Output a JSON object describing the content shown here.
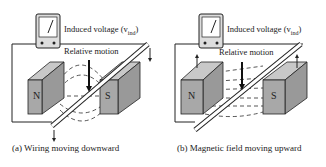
{
  "panels": [
    {
      "id": "a",
      "caption": "(a) Wiring moving downward",
      "voltage_label": "Induced voltage (v",
      "voltage_sub": "ind",
      "voltage_close": ")",
      "motion_label": "Relative motion",
      "north_label": "N",
      "south_label": "S"
    },
    {
      "id": "b",
      "caption": "(b) Magnetic field moving upward",
      "voltage_label": "Induced voltage (v",
      "voltage_sub": "ind",
      "voltage_close": ")",
      "motion_label": "Relative motion",
      "north_label": "N",
      "south_label": "S"
    }
  ],
  "colors": {
    "magnet_face": "#a8a8a8",
    "magnet_top": "#c8c8c8",
    "line": "#222222"
  }
}
